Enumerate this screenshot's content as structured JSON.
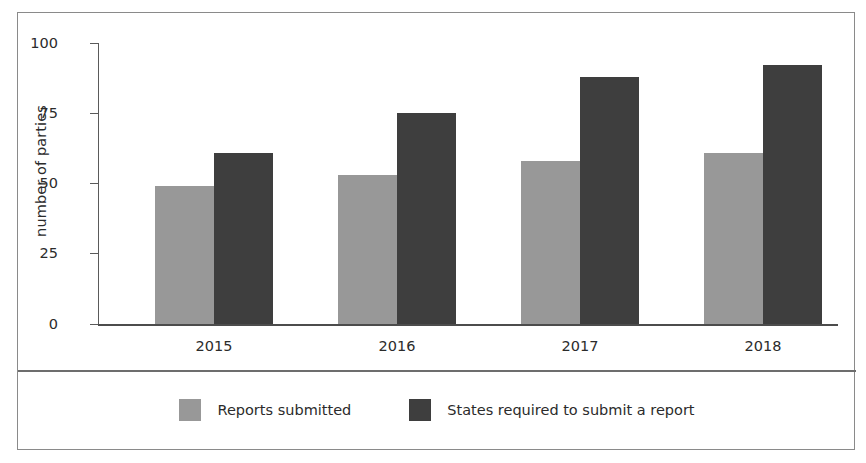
{
  "chart_data": {
    "type": "bar",
    "title": "",
    "subtitle": "",
    "xlabel": "",
    "ylabel": "number of parties",
    "categories": [
      "2015",
      "2016",
      "2017",
      "2018"
    ],
    "series": [
      {
        "name": "Reports submitted",
        "color": "#989898",
        "values": [
          49,
          53,
          58,
          61
        ]
      },
      {
        "name": "States required to submit a report",
        "color": "#3e3e3e",
        "values": [
          61,
          75,
          88,
          92
        ]
      }
    ],
    "ylim": [
      0,
      100
    ],
    "yticks": [
      0,
      25,
      50,
      75,
      100
    ],
    "ytick_labels": [
      "0",
      "25",
      "50",
      "75",
      "100"
    ],
    "grid": false,
    "legend_position": "bottom"
  },
  "axes": {
    "y_label": "number of parties",
    "y_ticks": [
      "100",
      "75",
      "50",
      "25",
      "0"
    ],
    "x_labels": [
      "2015",
      "2016",
      "2017",
      "2018"
    ]
  },
  "legend": {
    "items": [
      {
        "label": "Reports submitted",
        "swatch": "#989898"
      },
      {
        "label": "States required to submit a report",
        "swatch": "#3e3e3e"
      }
    ]
  },
  "colors": {
    "light_bar": "#989898",
    "dark_bar": "#3e3e3e",
    "frame_border": "#8a8a8a",
    "axis_line": "#5a5a5a",
    "text": "#2b2b2b",
    "background": "#ffffff"
  }
}
